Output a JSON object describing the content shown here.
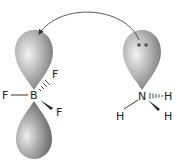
{
  "diagram": {
    "left_molecule": {
      "central_atom": "B",
      "substituents": [
        "F",
        "F",
        "F"
      ],
      "orbitals": [
        "empty p-orbital upper lobe",
        "p-orbital lower lobe"
      ]
    },
    "right_molecule": {
      "central_atom": "N",
      "substituents": [
        "H",
        "H",
        "H"
      ],
      "orbitals": [
        "lone-pair orbital"
      ],
      "lone_pair_dots": 2
    },
    "arrow": {
      "type": "curved",
      "from": "N lone pair",
      "to": "B empty orbital"
    },
    "labels": {
      "boron": "B",
      "f_left": "F",
      "f_upper_right": "F",
      "f_lower_right": "F",
      "nitrogen": "N",
      "h_right": "H",
      "h_lower_left": "H",
      "h_lower_right": "H"
    },
    "colors": {
      "lobe_light": "#e6e6e6",
      "lobe_dark": "#7a7a7a",
      "line": "#333333",
      "text": "#222222"
    }
  }
}
